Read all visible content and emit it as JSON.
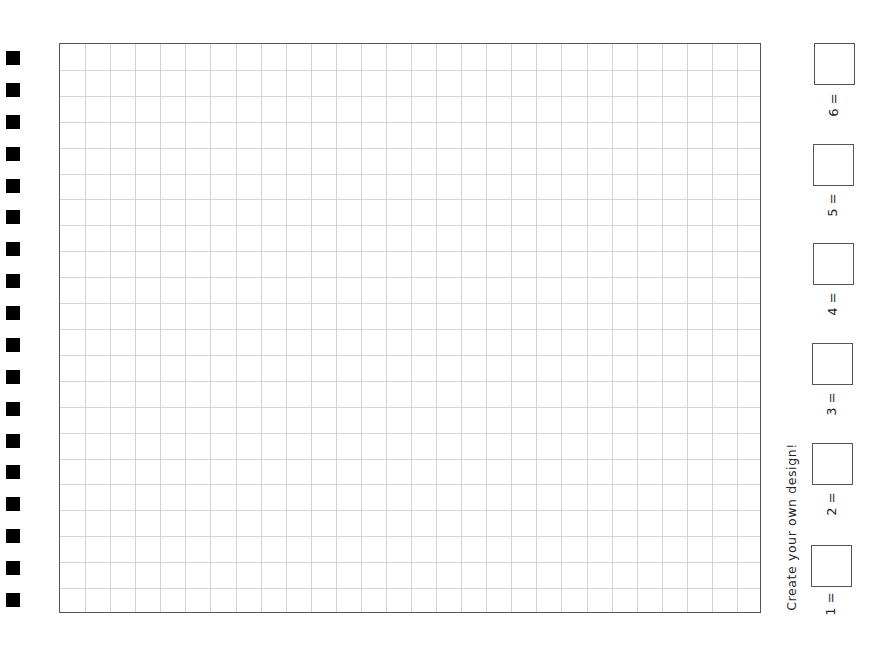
{
  "worksheet": {
    "tagline": "Create your own design!",
    "grid": {
      "columns": 28,
      "rows": 22,
      "line_color": "#d4d4d4",
      "border_color": "#555555"
    },
    "binding_holes": {
      "count": 18,
      "color": "#000000"
    },
    "legend": [
      {
        "label": "1 =",
        "value": ""
      },
      {
        "label": "2 =",
        "value": ""
      },
      {
        "label": "3 =",
        "value": ""
      },
      {
        "label": "4 =",
        "value": ""
      },
      {
        "label": "5 =",
        "value": ""
      },
      {
        "label": "6 =",
        "value": ""
      }
    ]
  }
}
